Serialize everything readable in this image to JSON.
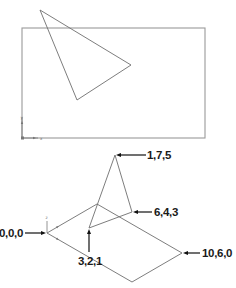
{
  "top_view": {
    "frame": {
      "x": 22,
      "y": 28,
      "width": 183,
      "height": 110
    },
    "triangle": {
      "points": [
        [
          40,
          10
        ],
        [
          131,
          65
        ],
        [
          77,
          100
        ]
      ]
    },
    "ucs_icon": {
      "origin": [
        22,
        138
      ],
      "x_label": "x",
      "y_label": "y"
    }
  },
  "iso_view": {
    "ucs_icon": {
      "origin": [
        47,
        233
      ],
      "z_label": "z"
    },
    "plane": {
      "points": [
        [
          47,
          233
        ],
        [
          97,
          204
        ],
        [
          182,
          253
        ],
        [
          132,
          282
        ]
      ]
    },
    "points": [
      {
        "id": "p000",
        "label": "0,0,0",
        "screen": [
          47,
          233
        ]
      },
      {
        "id": "p175",
        "label": "1,7,5",
        "screen": [
          115,
          155
        ]
      },
      {
        "id": "p643",
        "label": "6,4,3",
        "screen": [
          132,
          212
        ]
      },
      {
        "id": "p321",
        "label": "3,2,1",
        "screen": [
          89,
          228
        ]
      },
      {
        "id": "p1060",
        "label": "10,6,0",
        "screen": [
          182,
          253
        ]
      }
    ]
  }
}
